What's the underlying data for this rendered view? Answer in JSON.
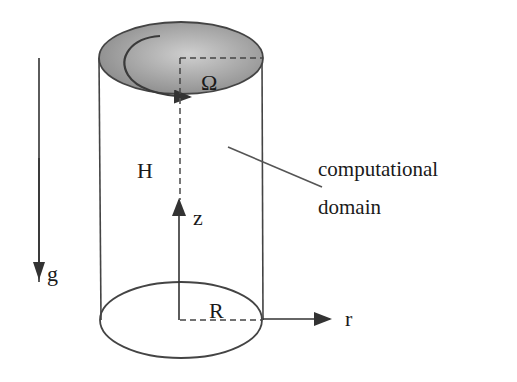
{
  "diagram": {
    "type": "rotating-cylinder-schematic",
    "labels": {
      "omega": "Ω",
      "height": "H",
      "z_axis": "z",
      "r_axis": "r",
      "radius": "R",
      "gravity": "g",
      "domain_line1": "computational",
      "domain_line2": "domain"
    },
    "colors": {
      "stroke": "#333333",
      "lid_fill_light": "#c8c8c8",
      "lid_fill_dark": "#8a8a8a",
      "text": "#1a1a1a",
      "background": "#ffffff"
    }
  }
}
